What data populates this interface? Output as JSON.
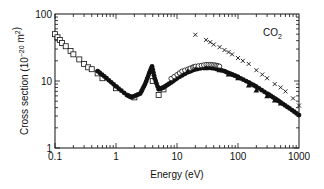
{
  "chart_data": {
    "type": "scatter",
    "title": "",
    "annotation": "CO2",
    "xlabel": "Energy (eV)",
    "ylabel": "Cross section (10^-20 m^2)",
    "xscale": "log",
    "yscale": "log",
    "xlim": [
      0.1,
      1000
    ],
    "ylim": [
      1,
      100
    ],
    "x_ticks": [
      "0.1",
      "1",
      "10",
      "100",
      "1000"
    ],
    "y_ticks": [
      "1",
      "10",
      "100"
    ],
    "grid": false,
    "legend": null,
    "series": [
      {
        "name": "open squares",
        "marker": "square-open",
        "x": [
          0.1,
          0.11,
          0.12,
          0.13,
          0.15,
          0.18,
          0.2,
          0.25,
          0.3,
          0.35,
          0.4,
          0.5,
          0.6,
          1.0,
          2.0,
          4.0,
          5.0,
          6.0
        ],
        "y": [
          50,
          45,
          41,
          37,
          33,
          28,
          25,
          21,
          18,
          16,
          15,
          13,
          11,
          7.8,
          5.7,
          10,
          6.2,
          7.5
        ]
      },
      {
        "name": "filled circles",
        "marker": "circle-filled",
        "x": [
          0.5,
          0.7,
          1.0,
          1.5,
          1.8,
          2.5,
          3.0,
          3.5,
          3.9,
          4.3,
          5.0,
          6.0,
          8.0,
          10,
          15,
          20,
          30,
          40,
          60,
          80,
          100,
          150,
          200,
          300,
          400,
          500,
          700,
          1000
        ],
        "y": [
          14,
          11,
          8.3,
          6.2,
          5.7,
          6.5,
          9,
          13,
          16.5,
          11,
          7.5,
          8,
          9.5,
          11,
          13.5,
          15,
          16,
          15.5,
          14,
          12.5,
          11.5,
          9.5,
          8.2,
          6.5,
          5.5,
          4.8,
          3.9,
          3.1
        ]
      },
      {
        "name": "open circles",
        "marker": "circle-open",
        "x": [
          8,
          10,
          12,
          15,
          18,
          20,
          25,
          30,
          35,
          40,
          45,
          50
        ],
        "y": [
          10.5,
          12,
          13.5,
          14.5,
          15.5,
          16,
          16.5,
          17,
          17,
          16.8,
          16.5,
          16
        ]
      },
      {
        "name": "filled triangles",
        "marker": "triangle-filled",
        "x": [
          15,
          20,
          30,
          50,
          70,
          100,
          150,
          200,
          300,
          400,
          500
        ],
        "y": [
          14,
          15,
          15.5,
          14.5,
          12.5,
          11,
          8.6,
          7.2,
          5.9,
          5.1,
          4.6
        ]
      },
      {
        "name": "crosses",
        "marker": "cross",
        "x": [
          20,
          30,
          35,
          40,
          50,
          60,
          70,
          80,
          100,
          120,
          150,
          200,
          250,
          300,
          400,
          500,
          600,
          800,
          1000
        ],
        "y": [
          49,
          41,
          38,
          35,
          32,
          29,
          27,
          25,
          22,
          20,
          18,
          14.5,
          12.5,
          11,
          9,
          8,
          7,
          5.5,
          4.3
        ]
      }
    ]
  }
}
